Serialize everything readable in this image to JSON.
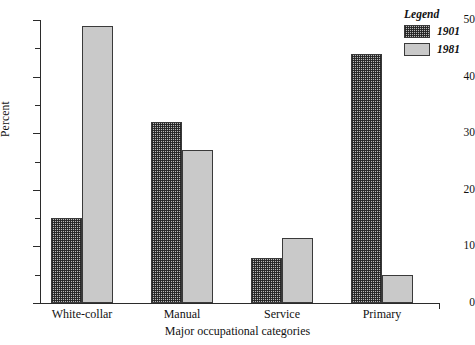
{
  "chart_data": {
    "type": "bar",
    "title": "",
    "subtitle": "",
    "xlabel": "Major occupational categories",
    "ylabel": "Percent",
    "categories": [
      "White-collar",
      "Manual",
      "Service",
      "Primary"
    ],
    "series": [
      {
        "name": "1901",
        "values": [
          15,
          32,
          8,
          44
        ],
        "fill": "crosshatch",
        "color": "#b9b9b9"
      },
      {
        "name": "1981",
        "values": [
          49,
          27,
          11.5,
          5
        ],
        "fill": "solid",
        "color": "#c9c9c9"
      }
    ],
    "ylim": [
      0,
      50
    ],
    "ytick_major": [
      0,
      10,
      20,
      30,
      40,
      50
    ],
    "ytick_minor": [
      5,
      15,
      25,
      35,
      45
    ],
    "ytick_labels": [
      "0",
      "10",
      "20",
      "30",
      "40",
      "50"
    ],
    "grid": false,
    "legend_position": "top-right",
    "legend_title": "Legend"
  },
  "axes": {
    "y_title": "Percent",
    "x_title": "Major occupational categories"
  },
  "legend": {
    "title": "Legend",
    "entries": [
      {
        "label": "1901"
      },
      {
        "label": "1981"
      }
    ]
  }
}
